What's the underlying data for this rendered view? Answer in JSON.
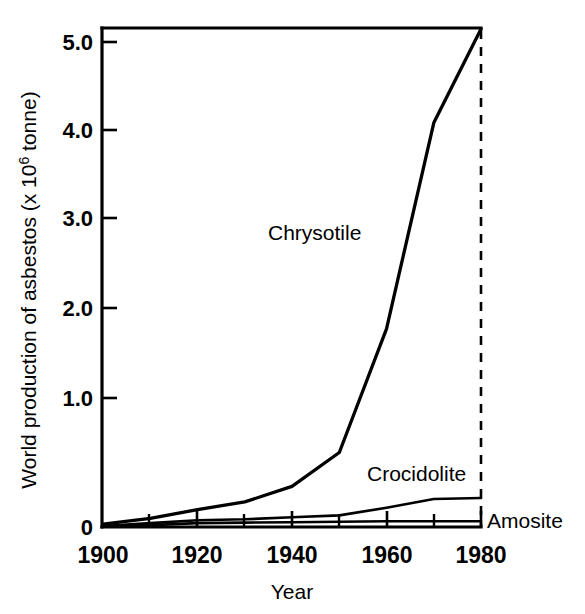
{
  "chart_data": {
    "type": "line",
    "title": "",
    "xlabel": "Year",
    "ylabel": "World production of asbestos (x 10⁶ tonne)",
    "ylabel_main": "World production of asbestos (x 10",
    "ylabel_exponent": "6",
    "ylabel_tail": " tonne)",
    "xlim": [
      1900,
      1980
    ],
    "ylim": [
      0,
      5.15
    ],
    "grid": false,
    "legend_position": "inline-annotations",
    "x_ticks": [
      1900,
      1920,
      1940,
      1960,
      1980
    ],
    "x_tick_labels": [
      "1900",
      "1920",
      "1940",
      "1960",
      "1980"
    ],
    "x_minor_ticks": [
      1910,
      1930,
      1950,
      1970
    ],
    "y_ticks": [
      0,
      1.0,
      2.0,
      3.0,
      4.0,
      5.0
    ],
    "y_tick_labels": [
      "0",
      "1.0",
      "2.0",
      "3.0",
      "4.0",
      "5.0"
    ],
    "annotations": [
      {
        "text": "Chrysotile",
        "x": 1943,
        "y": 2.85
      },
      {
        "text": "Crocidolite",
        "x": 1958,
        "y": 0.62
      },
      {
        "text": "Amosite",
        "x": 1982,
        "y": 0.05
      }
    ],
    "reference_line": {
      "x": 1980,
      "style": "dashed",
      "label": ""
    },
    "series": [
      {
        "name": "Chrysotile",
        "x": [
          1900,
          1910,
          1920,
          1930,
          1940,
          1950,
          1960,
          1970,
          1980
        ],
        "values": [
          0.03,
          0.09,
          0.18,
          0.26,
          0.42,
          0.77,
          2.05,
          4.18,
          5.15
        ]
      },
      {
        "name": "Crocidolite",
        "x": [
          1900,
          1910,
          1920,
          1930,
          1940,
          1950,
          1960,
          1970,
          1980
        ],
        "values": [
          0.01,
          0.04,
          0.07,
          0.08,
          0.1,
          0.12,
          0.2,
          0.29,
          0.3
        ]
      },
      {
        "name": "Amosite",
        "x": [
          1900,
          1910,
          1920,
          1930,
          1940,
          1950,
          1960,
          1970,
          1980
        ],
        "values": [
          0.005,
          0.02,
          0.04,
          0.045,
          0.05,
          0.055,
          0.06,
          0.06,
          0.06
        ]
      }
    ]
  }
}
